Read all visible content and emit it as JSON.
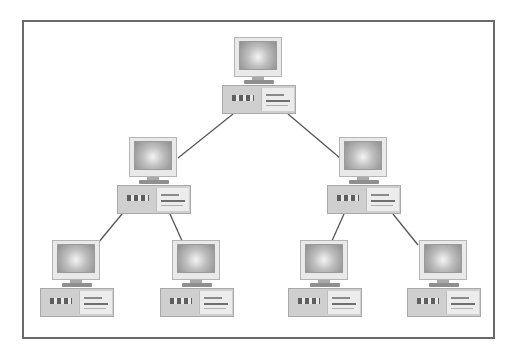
{
  "diagram": {
    "type": "tree-network-topology",
    "colors": {
      "frame": "#6a6a6a",
      "line": "#555555",
      "case": "#cfcfcf",
      "screen_center": "#f4f4f4",
      "screen_edge": "#8e8e8e"
    },
    "nodes": [
      {
        "id": "root",
        "level": 0,
        "icon": "desktop-computer-icon",
        "x": 222,
        "y": 37
      },
      {
        "id": "mid-left",
        "level": 1,
        "icon": "desktop-computer-icon",
        "x": 117,
        "y": 137
      },
      {
        "id": "mid-right",
        "level": 1,
        "icon": "desktop-computer-icon",
        "x": 327,
        "y": 137
      },
      {
        "id": "leaf-1",
        "level": 2,
        "icon": "desktop-computer-icon",
        "x": 40,
        "y": 240
      },
      {
        "id": "leaf-2",
        "level": 2,
        "icon": "desktop-computer-icon",
        "x": 160,
        "y": 240
      },
      {
        "id": "leaf-3",
        "level": 2,
        "icon": "desktop-computer-icon",
        "x": 288,
        "y": 240
      },
      {
        "id": "leaf-4",
        "level": 2,
        "icon": "desktop-computer-icon",
        "x": 407,
        "y": 240
      }
    ],
    "edges": [
      {
        "from": "root",
        "to": "mid-left",
        "x1": 233,
        "y1": 114,
        "x2": 178,
        "y2": 158
      },
      {
        "from": "root",
        "to": "mid-right",
        "x1": 288,
        "y1": 114,
        "x2": 340,
        "y2": 158
      },
      {
        "from": "mid-left",
        "to": "leaf-1",
        "x1": 122,
        "y1": 214,
        "x2": 98,
        "y2": 243
      },
      {
        "from": "mid-left",
        "to": "leaf-2",
        "x1": 170,
        "y1": 214,
        "x2": 183,
        "y2": 243
      },
      {
        "from": "mid-right",
        "to": "leaf-3",
        "x1": 344,
        "y1": 214,
        "x2": 331,
        "y2": 243
      },
      {
        "from": "mid-right",
        "to": "leaf-4",
        "x1": 393,
        "y1": 214,
        "x2": 418,
        "y2": 245
      }
    ]
  }
}
